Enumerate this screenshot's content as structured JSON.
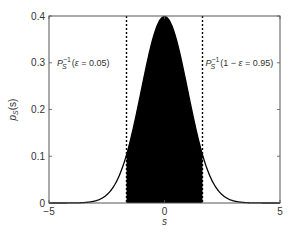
{
  "chart_data": {
    "type": "area",
    "title": "",
    "xlabel": "s",
    "ylabel": "p_S(s)",
    "ylabel_parts": {
      "base": "p",
      "sub": "S",
      "arg": "(s)"
    },
    "xlim": [
      -5,
      5
    ],
    "ylim": [
      0,
      0.4
    ],
    "xticks": [
      -5,
      0,
      5
    ],
    "xtick_labels": [
      "−5",
      "0",
      "5"
    ],
    "yticks": [
      0,
      0.1,
      0.2,
      0.3,
      0.4
    ],
    "ytick_labels": [
      "0",
      "0.1",
      "0.2",
      "0.3",
      "0.4"
    ],
    "grid": false,
    "series": [
      {
        "name": "standard normal pdf",
        "distribution": "normal",
        "mean": 0,
        "std": 1,
        "color": "#000000"
      }
    ],
    "shaded_region": {
      "from": -1.645,
      "to": 1.645,
      "color": "#000000"
    },
    "vlines": [
      {
        "x": -1.645,
        "style": "dotted",
        "color": "#000000"
      },
      {
        "x": 1.645,
        "style": "dotted",
        "color": "#000000"
      }
    ],
    "annotations": [
      {
        "id": "left",
        "P": "P",
        "sub": "S",
        "sup": "−1",
        "rest_open": "(",
        "eps": "ε",
        "rest": " = 0.05)",
        "x_anchor": -1.645,
        "y": 0.3
      },
      {
        "id": "right",
        "P": "P",
        "sub": "S",
        "sup": "−1",
        "rest_open": "(1 − ",
        "eps": "ε",
        "rest": " = 0.95)",
        "x_anchor": 1.645,
        "y": 0.3
      }
    ]
  }
}
